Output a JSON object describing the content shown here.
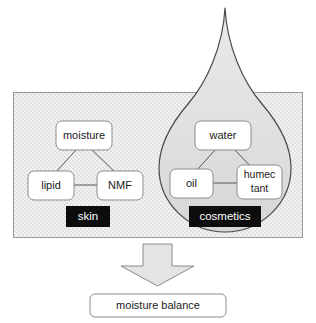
{
  "diagram": {
    "colors": {
      "page_background": "#ffffff",
      "panel_fill": "#ededed",
      "panel_texture": "#e2e2e2",
      "panel_border": "#9a9a9a",
      "droplet_fill": "#dedede",
      "droplet_border": "#4a4a4a",
      "node_fill": "#ffffff",
      "node_border": "#8c8c8c",
      "node_text": "#1a1a1a",
      "connector": "#555555",
      "tag_fill": "#0d0d0d",
      "tag_text": "#ffffff",
      "arrow_fill": "#e4e4e4",
      "arrow_border": "#8a8a8a",
      "result_fill": "#ffffff",
      "result_border": "#8c8c8c"
    },
    "panel": {
      "name": "skin-and-cosmetics-panel"
    },
    "droplet": {
      "name": "cosmetics-droplet"
    },
    "groups": [
      {
        "id": "skin",
        "tag_label": "skin",
        "nodes": [
          {
            "id": "moisture",
            "label": "moisture",
            "lines": [
              "moisture"
            ]
          },
          {
            "id": "lipid",
            "label": "lipid",
            "lines": [
              "lipid"
            ]
          },
          {
            "id": "nmf",
            "label": "NMF",
            "lines": [
              "NMF"
            ]
          }
        ],
        "connections": [
          {
            "from": "moisture",
            "to": "lipid"
          },
          {
            "from": "moisture",
            "to": "nmf"
          },
          {
            "from": "lipid",
            "to": "nmf"
          }
        ]
      },
      {
        "id": "cosmetics",
        "tag_label": "cosmetics",
        "nodes": [
          {
            "id": "water",
            "label": "water",
            "lines": [
              "water"
            ]
          },
          {
            "id": "oil",
            "label": "oil",
            "lines": [
              "oil"
            ]
          },
          {
            "id": "humectant",
            "label": "humectant",
            "lines": [
              "humec",
              "tant"
            ]
          }
        ],
        "connections": [
          {
            "from": "water",
            "to": "oil"
          },
          {
            "from": "water",
            "to": "humectant"
          },
          {
            "from": "oil",
            "to": "humectant"
          }
        ]
      }
    ],
    "arrow": {
      "name": "down-arrow",
      "direction": "down"
    },
    "result": {
      "label": "moisture balance"
    }
  }
}
